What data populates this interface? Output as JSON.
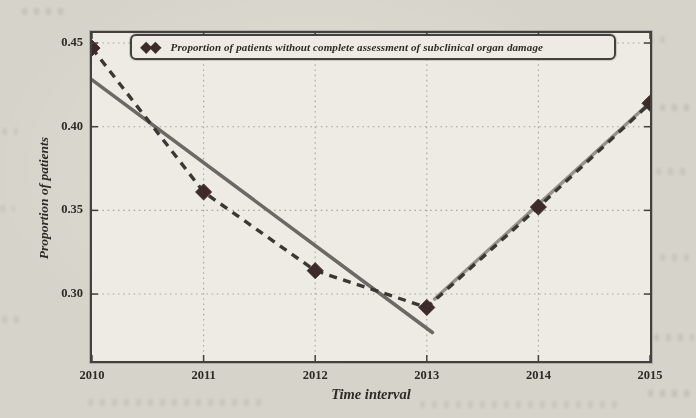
{
  "chart_data": {
    "type": "line",
    "title": "",
    "xlabel": "Time interval",
    "ylabel": "Proportion of patients",
    "x": [
      2010,
      2011,
      2012,
      2013,
      2014,
      2015
    ],
    "series": [
      {
        "name": "Proportion of patients without complete assessment of subclinical organ damage",
        "style": "dashed-with-diamond-markers",
        "values": [
          0.447,
          0.361,
          0.314,
          0.292,
          0.352,
          0.414
        ]
      },
      {
        "name": "decreasing-trend-segment",
        "style": "solid",
        "x": [
          2010,
          2013.05
        ],
        "values": [
          0.428,
          0.277
        ]
      },
      {
        "name": "increasing-trend-segment",
        "style": "solid",
        "x": [
          2013.07,
          2015
        ],
        "values": [
          0.297,
          0.4145
        ]
      }
    ],
    "xlim": [
      2010,
      2015
    ],
    "ylim": [
      0.26,
      0.456
    ],
    "xticks": [
      2010,
      2011,
      2012,
      2013,
      2014,
      2015
    ],
    "xtick_labels": [
      "2010",
      "2011",
      "2012",
      "2013",
      "2014",
      "2015"
    ],
    "yticks": [
      0.3,
      0.35,
      0.4,
      0.45
    ],
    "ytick_labels": [
      "0.30",
      "0.35",
      "0.40",
      "0.45"
    ],
    "grid": true,
    "legend_position": "upper center"
  },
  "legend": {
    "marker_glyph": "◆◆",
    "label": "Proportion of patients without complete assessment of subclinical organ damage"
  },
  "colors": {
    "page_background": "#d6d3ca",
    "plot_background": "#edebe3",
    "frame": "#43413e",
    "grid": "#a9a79e",
    "data_line": "#3b3734",
    "marker": "#3d2b2b",
    "trend_down_line": "#6b6965",
    "trend_up_line": "#949289",
    "text": "#2e2a26",
    "legend_border": "#43413e"
  }
}
